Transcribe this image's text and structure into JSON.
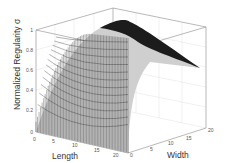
{
  "chart_data": {
    "type": "surface3d",
    "title": "",
    "xlabel": "Length",
    "ylabel": "Width",
    "zlabel": "Normalized Regularity σ",
    "x_ticks": [
      "0",
      "5",
      "10",
      "15",
      "20"
    ],
    "y_ticks": [
      "0",
      "5",
      "10",
      "15",
      "20"
    ],
    "z_ticks": [
      "0",
      "0.2",
      "0.4",
      "0.6",
      "0.8",
      "1"
    ],
    "xlim": [
      0,
      20
    ],
    "ylim": [
      0,
      20
    ],
    "zlim": [
      0,
      1
    ],
    "grid": true,
    "legend": null,
    "sample_surface": {
      "length": [
        0,
        5,
        10,
        15,
        20
      ],
      "width": [
        0,
        5,
        10,
        15,
        20
      ],
      "sigma": [
        [
          0.0,
          0.0,
          0.0,
          0.0,
          0.0
        ],
        [
          0.55,
          0.6,
          0.55,
          0.45,
          0.35
        ],
        [
          0.8,
          0.85,
          0.8,
          0.65,
          0.45
        ],
        [
          0.92,
          0.97,
          0.9,
          0.7,
          0.4
        ],
        [
          0.98,
          1.0,
          0.93,
          0.6,
          0.25
        ]
      ]
    },
    "colors": {
      "mesh": "#1a1a1a",
      "axes": "#888888",
      "grid": "#dddddd"
    }
  }
}
